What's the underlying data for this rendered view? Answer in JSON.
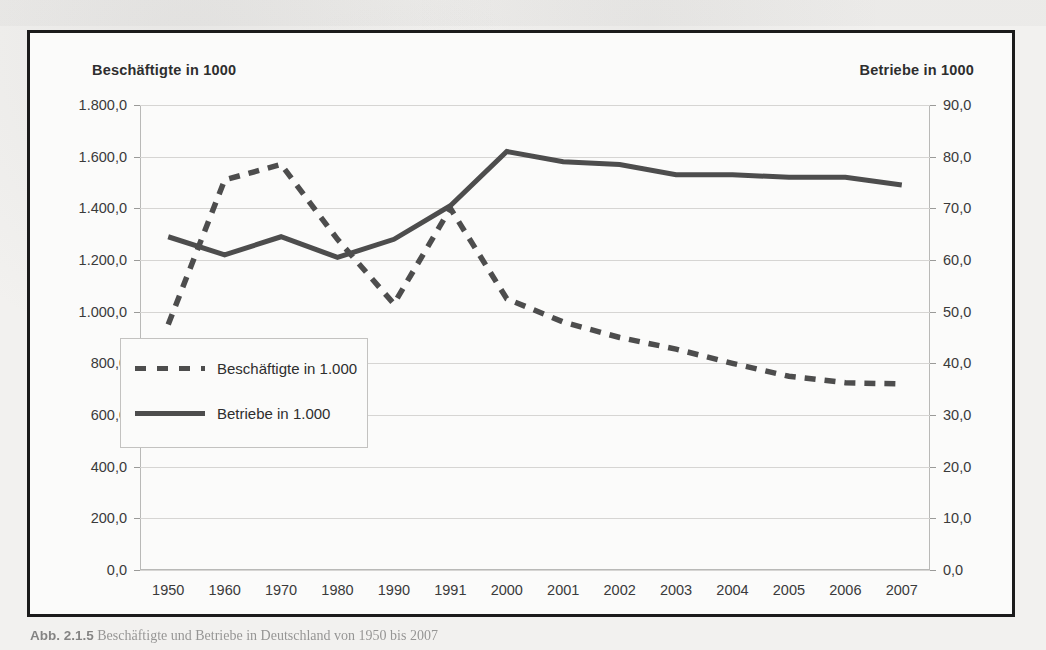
{
  "figure": {
    "caption_label": "Abb. 2.1.5",
    "caption_text": "Beschäftigte und Betriebe in Deutschland von 1950 bis 2007",
    "left_axis_title": "Beschäftigte in 1000",
    "right_axis_title": "Betriebe in 1000"
  },
  "legend": {
    "items": [
      {
        "label": "Beschäftigte in 1.000",
        "style": "dashed",
        "color": "#4d4d4d"
      },
      {
        "label": "Betriebe in 1.000",
        "style": "solid",
        "color": "#4d4d4d"
      }
    ]
  },
  "colors": {
    "series_line": "#4d4d4d",
    "frame_border": "#1b1b1b",
    "gridline": "#d6d5d3",
    "plot_background": "#fbfbfa",
    "page_background": "#f2f1ef",
    "text": "#3a3a3a"
  },
  "chart_data": {
    "type": "line",
    "title": "Beschäftigte und Betriebe in Deutschland von 1950 bis 2007",
    "xlabel": "",
    "ylabel": "Beschäftigte in 1000",
    "y2label": "Betriebe in 1000",
    "grid": true,
    "legend_position": "inside-left-lower",
    "categories": [
      "1950",
      "1960",
      "1970",
      "1980",
      "1990",
      "1991",
      "2000",
      "2001",
      "2002",
      "2003",
      "2004",
      "2005",
      "2006",
      "2007"
    ],
    "x_tick_labels": [
      "1950",
      "1960",
      "1970",
      "1980",
      "1990",
      "1991",
      "2000",
      "2001",
      "2002",
      "2003",
      "2004",
      "2005",
      "2006",
      "2007"
    ],
    "ylim": [
      0,
      1800
    ],
    "y_ticks": [
      0,
      200,
      400,
      600,
      800,
      1000,
      1200,
      1400,
      1600,
      1800
    ],
    "y_tick_labels": [
      "0,0",
      "200,0",
      "400,0",
      "600,0",
      "800,0",
      "1.000,0",
      "1.200,0",
      "1.400,0",
      "1.600,0",
      "1.800,0"
    ],
    "y2lim": [
      0,
      90
    ],
    "y2_ticks": [
      0,
      10,
      20,
      30,
      40,
      50,
      60,
      70,
      80,
      90
    ],
    "y2_tick_labels": [
      "0,0",
      "10,0",
      "20,0",
      "30,0",
      "40,0",
      "50,0",
      "60,0",
      "70,0",
      "80,0",
      "90,0"
    ],
    "series": [
      {
        "name": "Beschäftigte in 1.000",
        "axis": "left",
        "style": "dashed",
        "color": "#4d4d4d",
        "values": [
          950,
          1510,
          1570,
          1280,
          1030,
          1400,
          1050,
          960,
          900,
          855,
          800,
          750,
          725,
          720
        ]
      },
      {
        "name": "Betriebe in 1.000",
        "axis": "right",
        "style": "solid",
        "color": "#4d4d4d",
        "values": [
          64.5,
          61.0,
          64.5,
          60.5,
          64.0,
          70.5,
          81.0,
          79.0,
          78.5,
          76.5,
          76.5,
          76.0,
          76.0,
          74.5
        ]
      }
    ]
  }
}
